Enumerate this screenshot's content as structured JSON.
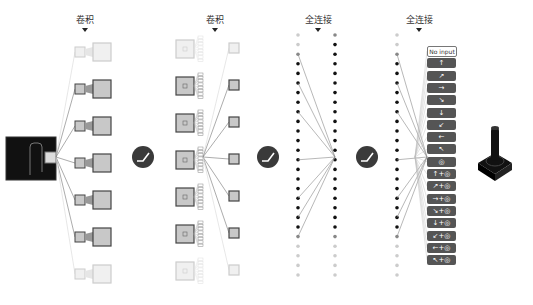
{
  "labels": {
    "conv1": "卷积",
    "conv2": "卷积",
    "fc1": "全连接",
    "fc2": "全连接"
  },
  "icons": {
    "relu": "relu-activation-icon",
    "input": "atari-game-screen-icon",
    "output": "joystick-icon"
  },
  "actions": [
    {
      "label": "No input",
      "kind": "noinput"
    },
    {
      "label": "↑",
      "kind": "dir"
    },
    {
      "label": "↗",
      "kind": "dir"
    },
    {
      "label": "→",
      "kind": "dir"
    },
    {
      "label": "↘",
      "kind": "dir"
    },
    {
      "label": "↓",
      "kind": "dir"
    },
    {
      "label": "↙",
      "kind": "dir"
    },
    {
      "label": "←",
      "kind": "dir"
    },
    {
      "label": "↖",
      "kind": "dir"
    },
    {
      "label": "◎",
      "kind": "fire"
    },
    {
      "label": "↑+◎",
      "kind": "dirfire"
    },
    {
      "label": "↗+◎",
      "kind": "dirfire"
    },
    {
      "label": "→+◎",
      "kind": "dirfire"
    },
    {
      "label": "↘+◎",
      "kind": "dirfire"
    },
    {
      "label": "↓+◎",
      "kind": "dirfire"
    },
    {
      "label": "↙+◎",
      "kind": "dirfire"
    },
    {
      "label": "←+◎",
      "kind": "dirfire"
    },
    {
      "label": "↖+◎",
      "kind": "dirfire"
    }
  ],
  "colors": {
    "line": "#888888",
    "dark": "#222222",
    "box_fill": "#c8c8c8",
    "box_stroke": "#444444",
    "faded": "#d8d8d8",
    "relu_bg": "#3a3a3a"
  }
}
